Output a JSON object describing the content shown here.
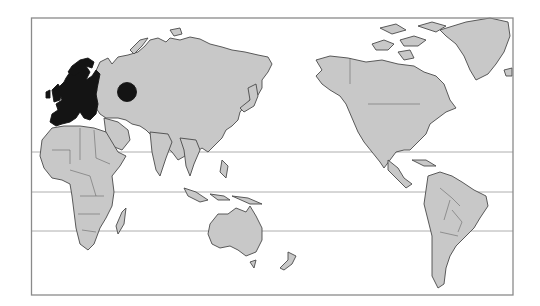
{
  "map": {
    "projection": "Pacific-centered world map",
    "background_color": "#ffffff",
    "land_color": "#c8c8c8",
    "outline_color": "#4a4a4a",
    "highlight_color": "#141414",
    "frame_color": "#8a8a8a",
    "highlighted_regions": [
      {
        "name": "Europe",
        "type": "shaded-region"
      }
    ],
    "markers": [
      {
        "name": "Western Russia",
        "type": "circle",
        "cx": 127,
        "cy": 92,
        "r": 9.5
      }
    ],
    "latitude_lines": [
      {
        "name": "tropic-of-cancer",
        "y": 152
      },
      {
        "name": "equator",
        "y": 192
      },
      {
        "name": "tropic-of-capricorn",
        "y": 231
      }
    ],
    "frame": {
      "x": 31,
      "y": 18,
      "width": 482,
      "height": 277
    }
  }
}
